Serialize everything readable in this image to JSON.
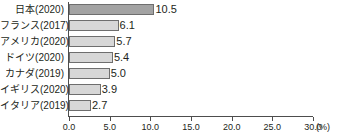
{
  "chart_data": {
    "type": "bar",
    "orientation": "horizontal",
    "title": "",
    "subtitle": "",
    "xlabel": "",
    "ylabel": "",
    "unit": "(%)",
    "xlim": [
      0.0,
      30.0
    ],
    "xticks": [
      "0.0",
      "5.0",
      "10.0",
      "15.0",
      "20.0",
      "25.0",
      "30.0"
    ],
    "xtick_values": [
      0.0,
      5.0,
      10.0,
      15.0,
      20.0,
      25.0,
      30.0
    ],
    "grid": false,
    "legend": "none",
    "categories": [
      "日本(2020)",
      "フランス(2017)",
      "アメリカ(2020)",
      "ドイツ(2020)",
      "カナダ(2019)",
      "イギリス(2020)",
      "イタリア(2019)"
    ],
    "values": [
      10.5,
      6.1,
      5.7,
      5.4,
      5.0,
      3.9,
      2.7
    ],
    "value_labels": [
      "10.5",
      "6.1",
      "5.7",
      "5.4",
      "5.0",
      "3.9",
      "2.7"
    ],
    "highlight_index": 0,
    "colors": {
      "bar_fill": "#d7d7d7",
      "bar_highlight_fill": "#a3a3a3",
      "bar_border": "#6e6e6e",
      "axis": "#4d4d4d",
      "text": "#231f20",
      "background": "#ffffff"
    }
  }
}
